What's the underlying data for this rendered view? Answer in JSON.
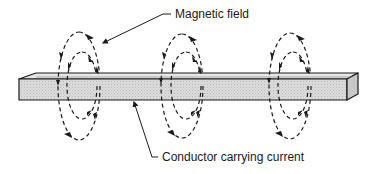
{
  "diagram": {
    "labels": {
      "magnetic_field": "Magnetic field",
      "conductor": "Conductor carrying current"
    },
    "colors": {
      "line": "#1a1a1a",
      "bar_front": "#d4d4d4",
      "bar_top": "#e2e2e2",
      "bar_end": "#c4c4c4",
      "background": "#ffffff"
    },
    "field_loops": [
      {
        "name": "loop-left",
        "outer_cx": 79,
        "inner_cx": 82
      },
      {
        "name": "loop-middle",
        "outer_cx": 182,
        "inner_cx": 186
      },
      {
        "name": "loop-right",
        "outer_cx": 290,
        "inner_cx": 293
      }
    ]
  }
}
